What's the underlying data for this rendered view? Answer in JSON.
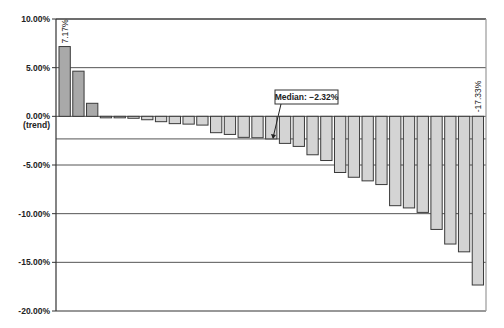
{
  "chart_data": {
    "type": "bar",
    "title": "",
    "xlabel": "",
    "ylabel": "",
    "ylim": [
      -20,
      10
    ],
    "yticks": [
      10,
      5,
      0,
      -5,
      -10,
      -15,
      -20
    ],
    "ytick_labels": [
      "10.00%",
      "5.00%",
      "0.00%",
      "-5.00%",
      "-10.00%",
      "-15.00%",
      "-20.00%"
    ],
    "ytick_sublabel_zero": "(trend)",
    "grid": true,
    "legend": null,
    "categories": [
      "1",
      "2",
      "3",
      "4",
      "5",
      "6",
      "7",
      "8",
      "9",
      "10",
      "11",
      "12",
      "13",
      "14",
      "15",
      "16",
      "17",
      "18",
      "19",
      "20",
      "21",
      "22",
      "23",
      "24",
      "25",
      "26",
      "27",
      "28",
      "29",
      "30",
      "31"
    ],
    "values": [
      7.17,
      4.64,
      1.34,
      -0.1,
      -0.15,
      -0.2,
      -0.35,
      -0.55,
      -0.75,
      -0.8,
      -0.9,
      -1.68,
      -1.86,
      -2.16,
      -2.2,
      -2.32,
      -2.78,
      -3.09,
      -3.95,
      -4.54,
      -5.77,
      -6.26,
      -6.63,
      -7.01,
      -9.18,
      -9.41,
      -9.87,
      -11.62,
      -13.12,
      -13.92,
      -17.33
    ],
    "data_labels": [
      {
        "index": 0,
        "text": "7.17%"
      },
      {
        "index": 30,
        "text": "-17.33%"
      }
    ],
    "median": {
      "value": -2.32,
      "label": "Median: −2.32%"
    },
    "colors": {
      "positive_fill": "#a9a9a9",
      "negative_fill": "#d4d4d4",
      "bar_outline": "#3a3a3a",
      "gridline": "#555555",
      "axis": "#333333"
    }
  }
}
